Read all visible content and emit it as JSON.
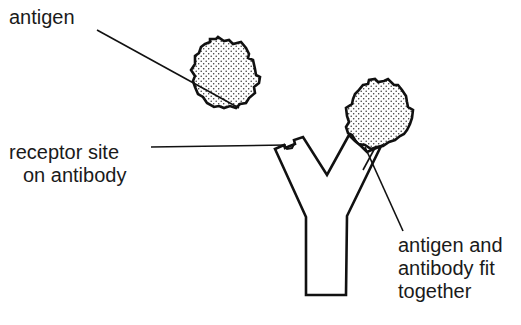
{
  "diagram": {
    "labels": {
      "antigen": "antigen",
      "receptor_site": {
        "line1": "receptor site",
        "line2": "on antibody"
      },
      "fit": {
        "line1": "antigen and",
        "line2": "antibody fit",
        "line3": "together"
      }
    },
    "elements": [
      {
        "name": "free-antigen",
        "shape": "stippled jagged circle",
        "center": [
          226,
          75
        ],
        "radius": 34
      },
      {
        "name": "bound-antigen",
        "shape": "stippled jagged circle",
        "center": [
          378,
          113
        ],
        "radius": 35
      },
      {
        "name": "antibody",
        "shape": "Y"
      }
    ],
    "colors": {
      "stroke": "#111111",
      "fill": "#ffffff",
      "stipple": "#333333",
      "text": "#1a1a1a"
    }
  }
}
